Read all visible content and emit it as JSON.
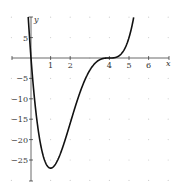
{
  "chart_data": {
    "type": "line",
    "title": "",
    "xlabel": "x",
    "ylabel": "y",
    "function": "y = x(x-4)^3",
    "xlim": [
      -1,
      7
    ],
    "ylim": [
      -30,
      10
    ],
    "grid": "dotted points",
    "x_ticks": [
      1,
      2,
      4,
      5,
      6
    ],
    "x_tick_labels": [
      "1",
      "2",
      "4",
      "5",
      "6"
    ],
    "y_ticks": [
      5,
      -5,
      -10,
      -15,
      -20,
      -25
    ],
    "y_tick_labels": [
      "5",
      "−5",
      "−10",
      "−15",
      "−20",
      "−25"
    ],
    "series": [
      {
        "name": "f(x)",
        "x": [
          -0.14,
          0,
          0.5,
          1,
          1.5,
          2,
          2.5,
          3,
          3.5,
          4,
          4.5,
          5,
          5.3
        ],
        "values": [
          9.9,
          0,
          -21.4,
          -27,
          -23.4,
          -16,
          -8.4,
          -3,
          -0.4,
          0,
          0.6,
          5,
          11.6
        ]
      }
    ],
    "annotations": {
      "minimum": {
        "x": 1,
        "y": -27
      }
    }
  }
}
